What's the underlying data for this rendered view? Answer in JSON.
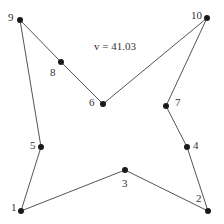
{
  "title": "v = 41.03",
  "edge_color": "#555555",
  "node_color": "#1a1a1a",
  "nodes": [
    {
      "id": "1",
      "x": 21,
      "y": 211,
      "lx": 11,
      "ly": 202
    },
    {
      "id": "2",
      "x": 208,
      "y": 211,
      "lx": 196,
      "ly": 193
    },
    {
      "id": "3",
      "x": 125,
      "y": 170,
      "lx": 122,
      "ly": 178
    },
    {
      "id": "4",
      "x": 187,
      "y": 147,
      "lx": 193,
      "ly": 140
    },
    {
      "id": "5",
      "x": 41,
      "y": 147,
      "lx": 30,
      "ly": 140
    },
    {
      "id": "6",
      "x": 103,
      "y": 104,
      "lx": 89,
      "ly": 97
    },
    {
      "id": "7",
      "x": 166,
      "y": 106,
      "lx": 175,
      "ly": 97
    },
    {
      "id": "8",
      "x": 61,
      "y": 62,
      "lx": 50,
      "ly": 67
    },
    {
      "id": "9",
      "x": 20,
      "y": 20,
      "lx": 8,
      "ly": 12
    },
    {
      "id": "10",
      "x": 207,
      "y": 18,
      "lx": 191,
      "ly": 10
    }
  ],
  "tour": [
    "1",
    "5",
    "9",
    "8",
    "6",
    "10",
    "7",
    "4",
    "2",
    "3",
    "1"
  ]
}
